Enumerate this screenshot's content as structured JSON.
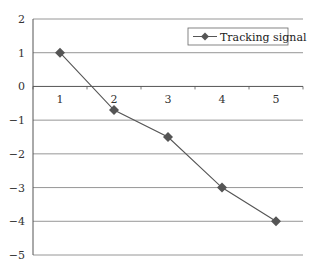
{
  "chart_data": {
    "type": "line",
    "title": "",
    "xlabel": "",
    "ylabel": "",
    "categories": [
      "1",
      "2",
      "3",
      "4",
      "5"
    ],
    "series": [
      {
        "name": "Tracking signal",
        "values": [
          1,
          -0.7,
          -1.5,
          -3,
          -4
        ],
        "color": "#555555",
        "marker": "diamond"
      }
    ],
    "yticks": [
      2,
      1,
      0,
      -1,
      -2,
      -3,
      -4,
      -5
    ],
    "ytick_labels": [
      "2",
      "1",
      "0",
      "−1",
      "−2",
      "−3",
      "−4",
      "−5"
    ],
    "ylim": [
      -5,
      2
    ],
    "grid": true,
    "legend_position": "top-right"
  },
  "legend": {
    "label": "Tracking signal"
  }
}
